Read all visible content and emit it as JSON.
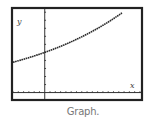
{
  "caption": "Graph.",
  "chart_data": {
    "type": "line",
    "title": "",
    "xlabel": "x",
    "ylabel": "y",
    "xlim": [
      -6,
      18.2
    ],
    "ylim": [
      -0.8,
      10.4
    ],
    "x_tick_step": 1,
    "y_tick_step": 1,
    "grid": false,
    "series": [
      {
        "name": "curve",
        "function": "y = 5 * 1.048^x",
        "x": [
          -6,
          -4,
          -2,
          0,
          2,
          4,
          6,
          8,
          10,
          12,
          14,
          14.6
        ],
        "y": [
          3.77,
          4.14,
          4.55,
          5.0,
          5.49,
          6.03,
          6.63,
          7.28,
          8.0,
          8.79,
          9.66,
          10.0
        ]
      }
    ]
  },
  "colors": {
    "frame": "#222222",
    "curve": "#2a2a2a",
    "axes": "#333333",
    "caption": "#777777"
  }
}
